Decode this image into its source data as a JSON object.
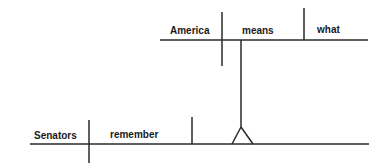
{
  "diagram": {
    "type": "sentence-diagram",
    "clause_main": {
      "subject": "Senators",
      "verb": "remember",
      "object_clause_connector": "noun-clause-on-pedestal"
    },
    "clause_noun": {
      "subject": "America",
      "verb": "means",
      "object": "what"
    },
    "colors": {
      "line": "#2a2a2a",
      "text": "#1a1a1a",
      "background": "#ffffff"
    }
  }
}
